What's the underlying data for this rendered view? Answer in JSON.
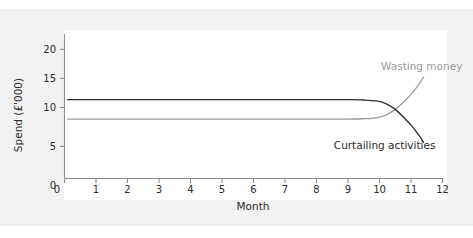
{
  "figure": {
    "clipped_header_text": "",
    "background_color": "#f2f2f2",
    "panel_color": "#ffffff"
  },
  "chart_data": {
    "type": "line",
    "title": "",
    "xlabel": "Month",
    "ylabel": "Spend (£'000)",
    "xlim": [
      0,
      12
    ],
    "ylim": [
      0,
      22
    ],
    "xticks": [
      0,
      1,
      2,
      3,
      4,
      5,
      6,
      7,
      8,
      9,
      10,
      11,
      12
    ],
    "xticklabels": [
      "0",
      "1",
      "2",
      "3",
      "4",
      "5",
      "6",
      "7",
      "8",
      "9",
      "10",
      "11",
      "12"
    ],
    "yticks": [
      0,
      5,
      10,
      15,
      20
    ],
    "yticklabels": [
      "0",
      "5",
      "10",
      "15",
      "20"
    ],
    "grid": false,
    "legend_position": "inline-annotation",
    "series": [
      {
        "name": "Curtailing activities",
        "color": "#2b2b2b",
        "annotation": "Curtailing activities",
        "x": [
          0.1,
          1,
          2,
          3,
          4,
          5,
          6,
          7,
          8,
          9,
          9.5,
          9.9,
          10.2,
          10.5,
          10.8,
          11.05,
          11.25,
          11.4
        ],
        "y": [
          12.2,
          12.2,
          12.2,
          12.2,
          12.2,
          12.2,
          12.2,
          12.2,
          12.2,
          12.2,
          12.15,
          12.0,
          11.6,
          10.7,
          9.3,
          8.0,
          6.7,
          5.6
        ]
      },
      {
        "name": "Wasting money",
        "color": "#9a9a9a",
        "annotation": "Wasting money",
        "x": [
          0.1,
          1,
          2,
          3,
          4,
          5,
          6,
          7,
          8,
          9,
          9.5,
          9.9,
          10.2,
          10.5,
          10.8,
          11.05,
          11.25,
          11.4
        ],
        "y": [
          9.2,
          9.2,
          9.2,
          9.2,
          9.2,
          9.2,
          9.2,
          9.2,
          9.2,
          9.2,
          9.25,
          9.4,
          9.8,
          10.7,
          12.0,
          13.3,
          14.6,
          15.7
        ]
      }
    ],
    "annotations": [
      {
        "text": "Wasting money",
        "x": 10.05,
        "y": 16.8,
        "color": "#9a9a9a",
        "anchor": "start"
      },
      {
        "text": "Curtailing activities",
        "x": 8.55,
        "y": 4.6,
        "color": "#2b2b2b",
        "anchor": "start"
      }
    ],
    "crossing_point": {
      "x": 10.5,
      "y": 10.7
    }
  }
}
